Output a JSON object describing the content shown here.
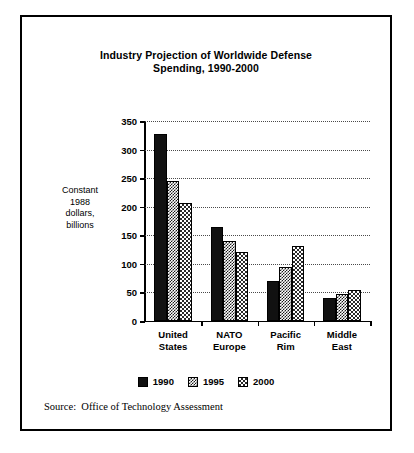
{
  "figure": {
    "title_lines": [
      "Industry Projection of Worldwide Defense",
      "Spending, 1990-2000"
    ],
    "title_full": "Industry Projection of Worldwide Defense Spending, 1990-2000",
    "y_caption_lines": [
      "Constant",
      "1988",
      "dollars,",
      "billions"
    ],
    "source_note": "Source:  Office of Technology Assessment",
    "border_color": "#000000",
    "background_color": "#ffffff"
  },
  "chart_data": {
    "type": "bar",
    "title": "Industry Projection of Worldwide Defense Spending, 1990-2000",
    "subtitle": "",
    "xlabel": "",
    "ylabel": "Constant 1988 dollars, billions",
    "categories": [
      "United States",
      "NATO Europe",
      "Pacific Rim",
      "Middle East"
    ],
    "category_lines": [
      [
        "United",
        "States"
      ],
      [
        "NATO",
        "Europe"
      ],
      [
        "Pacific",
        "Rim"
      ],
      [
        "Middle",
        "East"
      ]
    ],
    "series": [
      {
        "name": "1990",
        "values": [
          327,
          165,
          70,
          40
        ],
        "fill": "solid-black",
        "color": "#111111"
      },
      {
        "name": "1995",
        "values": [
          245,
          140,
          95,
          48
        ],
        "fill": "checker-dark",
        "color": "#1a1a1a"
      },
      {
        "name": "2000",
        "values": [
          206,
          120,
          132,
          55
        ],
        "fill": "checker-light",
        "color": "#2a2a2a"
      }
    ],
    "ylim": [
      0,
      350
    ],
    "yticks": [
      0,
      50,
      100,
      150,
      200,
      250,
      300,
      350
    ],
    "ytick_labels": [
      "0",
      "50",
      "100",
      "150",
      "200",
      "250",
      "300",
      "350"
    ],
    "grid": true,
    "grid_style": "dotted-horizontal",
    "legend_position": "bottom-center",
    "legend_entries": [
      "1990",
      "1995",
      "2000"
    ]
  }
}
